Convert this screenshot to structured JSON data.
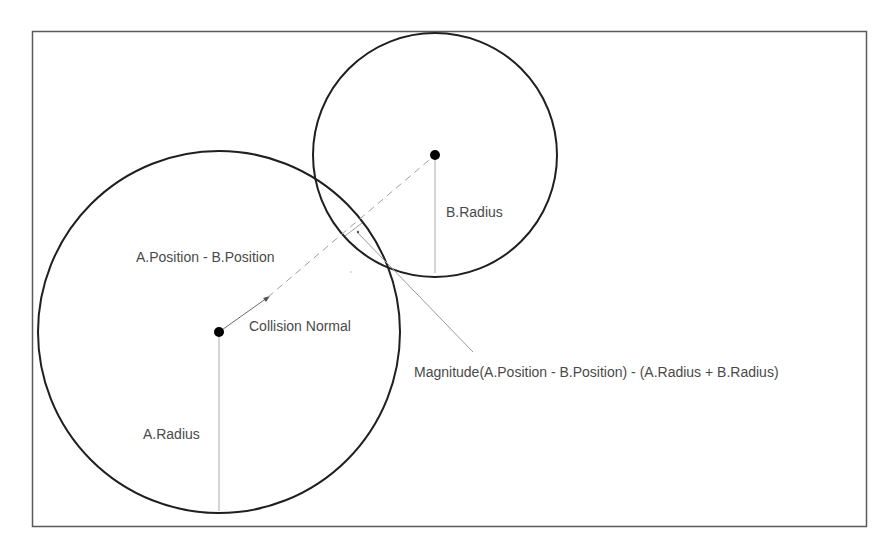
{
  "diagram": {
    "frame": {
      "x": 32,
      "y": 31,
      "width": 835,
      "height": 496,
      "stroke": "#555555"
    },
    "circles": [
      {
        "name": "A",
        "cx": 219,
        "cy": 332,
        "r": 181,
        "stroke": "#1f1f1f"
      },
      {
        "name": "B",
        "cx": 435,
        "cy": 155,
        "r": 122,
        "stroke": "#1f1f1f"
      }
    ],
    "labels": {
      "position_difference": "A.Position - B.Position",
      "collision_normal": "Collision Normal",
      "a_radius": "A.Radius",
      "b_radius": "B.Radius",
      "penetration": "Magnitude(A.Position - B.Position) - (A.Radius + B.Radius)"
    },
    "colors": {
      "line": "#1f1f1f",
      "thin_line": "#9a9a9a",
      "text": "#4a4a4a",
      "background": "#ffffff"
    }
  }
}
